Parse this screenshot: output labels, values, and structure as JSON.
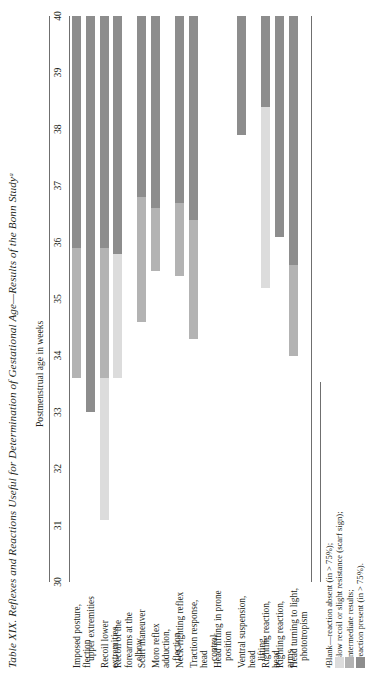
{
  "figure": {
    "table_number": "Table XIX.",
    "title": "Reflexes and Reactions Useful for Determination of Gestational Age—Results of the Bonn Studyᵃ",
    "axis_caption": "Postmenstrual age in weeks"
  },
  "footnote": {
    "lines": [
      "ᵃBlank—reaction absent (in > 75%);",
      "—slow recoil or slight resistance (scarf sign);",
      "—intermediate results;",
      "—reaction present (in > 75%)."
    ]
  },
  "colors": {
    "bar_light": "#dcdcdc",
    "bar_mid": "#b3b3b3",
    "bar_dark": "#8d8d8d",
    "rule": "#6f6f6f",
    "text": "#231f20"
  },
  "chart_data": {
    "type": "bar",
    "title": "Table XIX. Reflexes and Reactions Useful for Determination of Gestational Age—Results of the Bonn Study",
    "xlabel": "Postmenstrual age in weeks",
    "ylabel": "",
    "xlim": [
      30,
      40
    ],
    "grid": false,
    "legend_position": "below-left",
    "tick_labels": [
      "30",
      "31",
      "32",
      "33",
      "34",
      "35",
      "36",
      "37",
      "38",
      "39",
      "40"
    ],
    "legend": [
      {
        "key": "blank",
        "color": "#ffffff",
        "label": "reaction absent (in > 75%)"
      },
      {
        "key": "light",
        "color": "#dcdcdc",
        "label": "slow recoil or slight resistance (scarf sign)"
      },
      {
        "key": "mid",
        "color": "#b3b3b3",
        "label": "intermediate results"
      },
      {
        "key": "dark",
        "color": "#8d8d8d",
        "label": "reaction present (in > 75%)"
      }
    ],
    "categories": [
      "Imposed posture, flection",
      "Recoil upper extremities",
      "Recoil lower extremities",
      "Recoil of the forearms at the elbow",
      "Scarf maneuver",
      "Moro reflex adduction, flection",
      "Neck-righting reflex",
      "Traction response, head control",
      "Head lifting in prone position",
      "Ventral suspension, head lifting",
      "Righting reaction, head",
      "Righting reaction, arms",
      "Head turning to light, phototropism"
    ],
    "rows": [
      {
        "label_lines": [
          "Imposed posture, flection"
        ],
        "segments": [
          {
            "from": 33.6,
            "to": 35.9,
            "shade": "mid"
          },
          {
            "from": 35.9,
            "to": 40.0,
            "shade": "dark"
          }
        ]
      },
      {
        "label_lines": [
          "upper extremities"
        ],
        "indent": [
          true
        ],
        "segments": [
          {
            "from": 33.0,
            "to": 40.0,
            "shade": "dark"
          }
        ]
      },
      {
        "label_lines": [
          "Recoil lower extremities"
        ],
        "segments": [
          {
            "from": 31.1,
            "to": 33.6,
            "shade": "light"
          },
          {
            "from": 33.6,
            "to": 35.9,
            "shade": "mid"
          },
          {
            "from": 35.9,
            "to": 40.0,
            "shade": "dark"
          }
        ]
      },
      {
        "label_lines": [
          "Recoil of the forearms at the",
          "elbow"
        ],
        "indent": [
          false,
          true
        ],
        "segments": [
          {
            "from": 33.6,
            "to": 35.8,
            "shade": "light"
          },
          {
            "from": 35.8,
            "to": 40.0,
            "shade": "dark"
          }
        ]
      },
      {
        "label_lines": [
          "Scarf maneuver"
        ],
        "segments": [
          {
            "from": 34.6,
            "to": 36.8,
            "shade": "mid"
          },
          {
            "from": 36.8,
            "to": 40.0,
            "shade": "dark"
          }
        ]
      },
      {
        "label_lines": [
          "Moro reflex adduction,",
          "flection"
        ],
        "indent": [
          false,
          true
        ],
        "segments": [
          {
            "from": 35.5,
            "to": 36.6,
            "shade": "mid"
          },
          {
            "from": 36.6,
            "to": 40.0,
            "shade": "dark"
          }
        ]
      },
      {
        "label_lines": [
          "Neck-righting reflex"
        ],
        "segments": [
          {
            "from": 35.4,
            "to": 36.7,
            "shade": "mid"
          },
          {
            "from": 36.7,
            "to": 40.0,
            "shade": "dark"
          }
        ]
      },
      {
        "label_lines": [
          "Traction response, head",
          "control"
        ],
        "indent": [
          false,
          true
        ],
        "segments": [
          {
            "from": 34.3,
            "to": 36.4,
            "shade": "mid"
          },
          {
            "from": 36.4,
            "to": 40.0,
            "shade": "dark"
          }
        ]
      },
      {
        "label_lines": [
          "Head lifting in prone",
          "position"
        ],
        "indent": [
          false,
          true
        ],
        "segments": []
      },
      {
        "label_lines": [
          "Ventral suspension, head",
          "lifting"
        ],
        "indent": [
          false,
          true
        ],
        "segments": [
          {
            "from": 37.9,
            "to": 40.0,
            "shade": "dark"
          }
        ]
      },
      {
        "label_lines": [
          "Righting reaction, head"
        ],
        "segments": [
          {
            "from": 35.2,
            "to": 38.4,
            "shade": "light"
          },
          {
            "from": 38.4,
            "to": 40.0,
            "shade": "dark"
          }
        ]
      },
      {
        "label_lines": [
          "Righting reaction, arms"
        ],
        "segments": [
          {
            "from": 36.1,
            "to": 40.0,
            "shade": "dark"
          }
        ]
      },
      {
        "label_lines": [
          "Head turning to light,",
          "phototropism"
        ],
        "indent": [
          false,
          true
        ],
        "segments": [
          {
            "from": 34.0,
            "to": 35.6,
            "shade": "mid"
          },
          {
            "from": 35.6,
            "to": 40.0,
            "shade": "dark"
          }
        ]
      }
    ]
  }
}
